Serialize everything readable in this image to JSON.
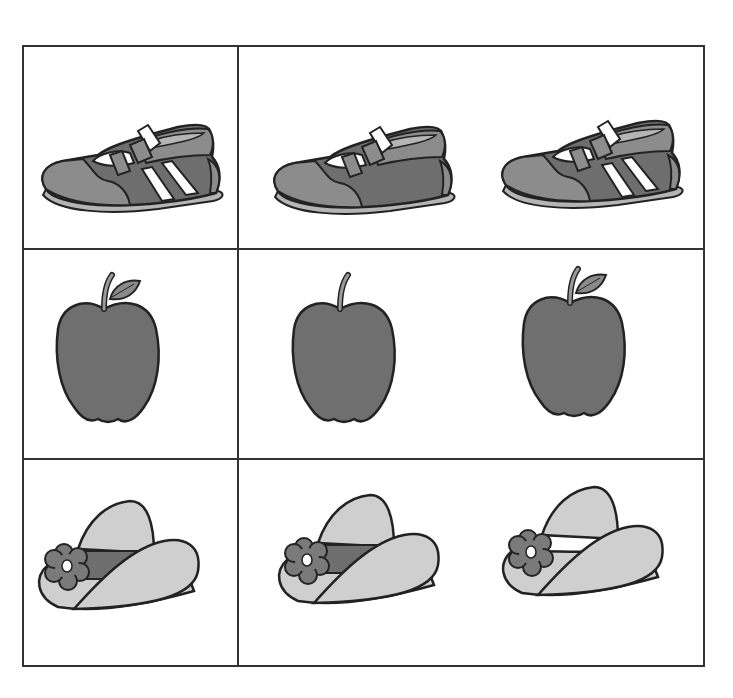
{
  "worksheet": {
    "title": "",
    "rows": [
      {
        "name": "shoe",
        "example": {
          "object": "sneaker",
          "stripes": true
        },
        "choices": [
          {
            "object": "sneaker",
            "stripes": false
          },
          {
            "object": "sneaker",
            "stripes": true
          }
        ]
      },
      {
        "name": "apple",
        "example": {
          "object": "apple",
          "leaf": true
        },
        "choices": [
          {
            "object": "apple",
            "leaf": false
          },
          {
            "object": "apple",
            "leaf": true
          }
        ]
      },
      {
        "name": "hat",
        "example": {
          "object": "hat",
          "band": true,
          "flower": true
        },
        "choices": [
          {
            "object": "hat",
            "band": true,
            "flower": true
          },
          {
            "object": "hat",
            "band": false,
            "flower": true
          }
        ]
      }
    ]
  },
  "colors": {
    "outline": "#222222",
    "shoe_dark": "#6e6e6e",
    "shoe_mid": "#8c8c8c",
    "shoe_sole": "#b5b5b5",
    "apple": "#6f6f6f",
    "leaf": "#8a8a8a",
    "hat": "#cfcfcf",
    "band": "#6e6e6e",
    "flower": "#7a7a7a",
    "grid": "#333333"
  }
}
